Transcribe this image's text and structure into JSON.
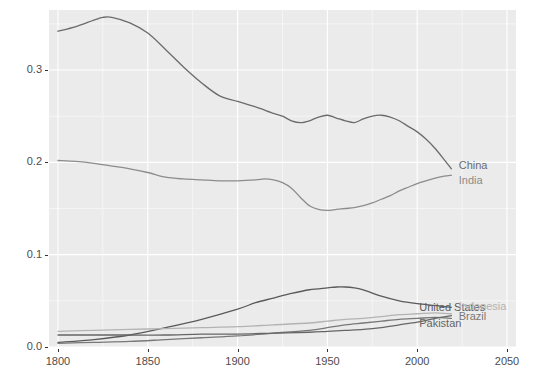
{
  "chart_data": {
    "type": "line",
    "title": "",
    "subtitle": "",
    "xlabel": "",
    "ylabel": "",
    "xlim": [
      1795,
      2055
    ],
    "ylim": [
      0.0,
      0.365
    ],
    "x_ticks": [
      "1800",
      "1850",
      "1900",
      "1950",
      "2000",
      "2050"
    ],
    "x_tick_values": [
      1800,
      1850,
      1900,
      1950,
      2000,
      2050
    ],
    "y_ticks": [
      "0.0",
      "0.1",
      "0.2",
      "0.3"
    ],
    "y_tick_values": [
      0.0,
      0.1,
      0.2,
      0.3
    ],
    "grid": "major-and-minor",
    "grid_major_color": "#ffffff",
    "grid_minor_color": "#f5f5f5",
    "panel_background": "#ebebeb",
    "legend_position": "direct-labels-right",
    "series": [
      {
        "name": "China",
        "color": "#6b6b6b",
        "label_x": 2022,
        "label_y": 0.197,
        "x": [
          1800,
          1810,
          1820,
          1825,
          1830,
          1840,
          1850,
          1860,
          1870,
          1880,
          1890,
          1900,
          1910,
          1920,
          1925,
          1930,
          1935,
          1940,
          1945,
          1950,
          1955,
          1960,
          1965,
          1970,
          1975,
          1980,
          1985,
          1990,
          1995,
          2000,
          2005,
          2010,
          2015,
          2019
        ],
        "values": [
          0.342,
          0.347,
          0.354,
          0.357,
          0.357,
          0.351,
          0.34,
          0.322,
          0.303,
          0.286,
          0.272,
          0.266,
          0.26,
          0.253,
          0.25,
          0.245,
          0.243,
          0.245,
          0.249,
          0.251,
          0.248,
          0.245,
          0.243,
          0.247,
          0.25,
          0.251,
          0.249,
          0.245,
          0.239,
          0.233,
          0.225,
          0.215,
          0.203,
          0.193
        ]
      },
      {
        "name": "India",
        "color": "#8c8c8c",
        "label_x": 2022,
        "label_y": 0.181,
        "x": [
          1800,
          1810,
          1820,
          1830,
          1840,
          1850,
          1860,
          1870,
          1880,
          1890,
          1900,
          1910,
          1915,
          1920,
          1925,
          1930,
          1935,
          1940,
          1945,
          1950,
          1955,
          1960,
          1965,
          1970,
          1975,
          1980,
          1985,
          1990,
          1995,
          2000,
          2005,
          2010,
          2015,
          2019
        ],
        "values": [
          0.202,
          0.201,
          0.199,
          0.196,
          0.193,
          0.189,
          0.184,
          0.182,
          0.181,
          0.18,
          0.18,
          0.181,
          0.182,
          0.181,
          0.178,
          0.172,
          0.162,
          0.153,
          0.149,
          0.148,
          0.149,
          0.15,
          0.151,
          0.153,
          0.156,
          0.16,
          0.164,
          0.169,
          0.173,
          0.177,
          0.18,
          0.183,
          0.185,
          0.186
        ]
      },
      {
        "name": "United States",
        "color": "#5a5a5a",
        "label_x": 2000,
        "label_y": 0.043,
        "x": [
          1800,
          1820,
          1840,
          1860,
          1880,
          1900,
          1910,
          1920,
          1930,
          1940,
          1950,
          1955,
          1960,
          1965,
          1970,
          1980,
          1990,
          2000,
          2010,
          2019
        ],
        "values": [
          0.005,
          0.008,
          0.013,
          0.021,
          0.03,
          0.041,
          0.048,
          0.053,
          0.058,
          0.062,
          0.064,
          0.065,
          0.065,
          0.064,
          0.062,
          0.055,
          0.05,
          0.047,
          0.045,
          0.043
        ]
      },
      {
        "name": "Indonesia",
        "color": "#b3b3b3",
        "label_x": 2022,
        "label_y": 0.044,
        "x": [
          1800,
          1820,
          1840,
          1860,
          1880,
          1900,
          1920,
          1940,
          1950,
          1960,
          1970,
          1980,
          1990,
          2000,
          2010,
          2019
        ],
        "values": [
          0.017,
          0.018,
          0.019,
          0.02,
          0.021,
          0.022,
          0.024,
          0.026,
          0.028,
          0.03,
          0.031,
          0.033,
          0.035,
          0.036,
          0.037,
          0.036
        ]
      },
      {
        "name": "Brazil",
        "color": "#787878",
        "label_x": 2022,
        "label_y": 0.034,
        "x": [
          1800,
          1820,
          1840,
          1860,
          1880,
          1900,
          1920,
          1940,
          1950,
          1960,
          1970,
          1980,
          1990,
          2000,
          2010,
          2019
        ],
        "values": [
          0.004,
          0.005,
          0.006,
          0.008,
          0.01,
          0.012,
          0.015,
          0.018,
          0.021,
          0.024,
          0.026,
          0.028,
          0.03,
          0.031,
          0.032,
          0.031
        ]
      },
      {
        "name": "Pakistan",
        "color": "#666666",
        "label_x": 2000,
        "label_y": 0.026,
        "x": [
          1800,
          1820,
          1840,
          1860,
          1880,
          1900,
          1920,
          1940,
          1950,
          1960,
          1970,
          1980,
          1990,
          2000,
          2010,
          2019
        ],
        "values": [
          0.013,
          0.013,
          0.013,
          0.013,
          0.014,
          0.014,
          0.015,
          0.016,
          0.017,
          0.018,
          0.019,
          0.021,
          0.024,
          0.027,
          0.031,
          0.034
        ]
      }
    ]
  }
}
